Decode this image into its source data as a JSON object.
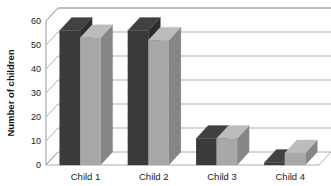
{
  "chart_data": {
    "type": "bar",
    "title": "",
    "subtitle": "",
    "xlabel": "",
    "ylabel": "Number of children",
    "categories": [
      "Child 1",
      "Child 2",
      "Child 3",
      "Child 4"
    ],
    "series": [
      {
        "name": "Series 1",
        "color": "#3a3a3a",
        "values": [
          56,
          56,
          11,
          1
        ]
      },
      {
        "name": "Series 2",
        "color": "#a8a8a8",
        "values": [
          53,
          52,
          11,
          5
        ]
      }
    ],
    "ylim": [
      0,
      60
    ],
    "yticks": [
      0,
      10,
      20,
      30,
      40,
      50,
      60
    ],
    "ytick_labels": [
      "0",
      "10",
      "20",
      "30",
      "40",
      "50",
      "60"
    ],
    "grid": true,
    "grid_axis": "y",
    "legend": false,
    "legend_position": "none",
    "style": "3d-clustered-column",
    "background": "#ffffff",
    "gridline_color": "#8d8d8d",
    "text_color": "#1a1a1a"
  }
}
